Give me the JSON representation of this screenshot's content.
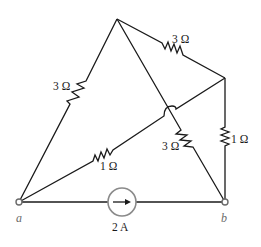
{
  "diagram": {
    "type": "circuit",
    "nodes": {
      "a": {
        "label": "a",
        "x": 19,
        "y": 202
      },
      "b": {
        "label": "b",
        "x": 225,
        "y": 202
      },
      "top": {
        "x": 117,
        "y": 19
      },
      "right": {
        "x": 225,
        "y": 78
      }
    },
    "resistors": [
      {
        "id": "r_a_top",
        "label": "3 Ω",
        "from": "a",
        "to": "top"
      },
      {
        "id": "r_top_right",
        "label": "3 Ω",
        "from": "top",
        "to": "right"
      },
      {
        "id": "r_top_b",
        "label": "3 Ω",
        "from": "top",
        "to": "b"
      },
      {
        "id": "r_right_b",
        "label": "1 Ω",
        "from": "right",
        "to": "b"
      },
      {
        "id": "r_a_right",
        "label": "1 Ω",
        "from": "a",
        "to": "right"
      }
    ],
    "current_source": {
      "label": "2 A",
      "from": "a",
      "to": "b",
      "direction": "right"
    },
    "crossover": {
      "note": "wire a–right hops over wire top–b"
    },
    "colors": {
      "wire": "#1a1a1a",
      "terminal": "#6b6b6b",
      "source": "#8a8a8a"
    }
  }
}
